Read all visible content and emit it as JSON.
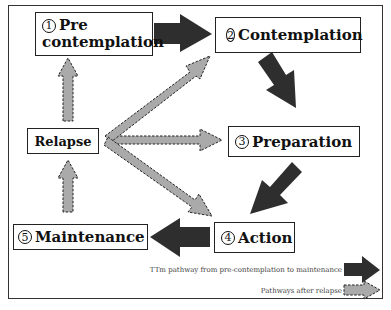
{
  "stages": [
    {
      "num": "1",
      "label": "Pre",
      "label2": "contemplation"
    },
    {
      "num": "2",
      "label": "Contemplation"
    },
    {
      "num": "3",
      "label": "Preparation"
    },
    {
      "num": "4",
      "label": "Action"
    },
    {
      "num": "5",
      "label": "Maintenance"
    }
  ],
  "relapse": {
    "label": "Relapse"
  },
  "legend": {
    "ttm": "TTm pathway from pre-contemplation to maintenance",
    "relapse": "Pathways after relapse"
  },
  "colors": {
    "ttm_arrow": "#2e2e2e",
    "relapse_arrow": "#aaaaaa",
    "relapse_border": "#222222"
  }
}
